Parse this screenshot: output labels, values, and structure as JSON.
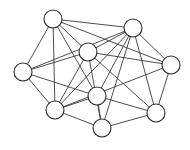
{
  "diagram": {
    "type": "network-graph",
    "width": 190,
    "height": 150,
    "node_radius": 9,
    "colors": {
      "background": "#ffffff",
      "node_fill": "#ffffff",
      "node_stroke": "#2a2a2a",
      "edge_stroke": "#3a3a3a"
    },
    "nodes": [
      {
        "id": "A",
        "x": 53,
        "y": 19
      },
      {
        "id": "B",
        "x": 133,
        "y": 28
      },
      {
        "id": "C",
        "x": 88,
        "y": 52
      },
      {
        "id": "D",
        "x": 23,
        "y": 72
      },
      {
        "id": "E",
        "x": 171,
        "y": 65
      },
      {
        "id": "F",
        "x": 97,
        "y": 96
      },
      {
        "id": "G",
        "x": 55,
        "y": 110
      },
      {
        "id": "H",
        "x": 156,
        "y": 113
      },
      {
        "id": "I",
        "x": 102,
        "y": 128
      }
    ],
    "edges": [
      [
        "A",
        "B"
      ],
      [
        "A",
        "D"
      ],
      [
        "A",
        "G"
      ],
      [
        "A",
        "F"
      ],
      [
        "A",
        "E"
      ],
      [
        "A",
        "C"
      ],
      [
        "B",
        "C"
      ],
      [
        "B",
        "D"
      ],
      [
        "B",
        "G"
      ],
      [
        "B",
        "F"
      ],
      [
        "B",
        "I"
      ],
      [
        "B",
        "H"
      ],
      [
        "B",
        "E"
      ],
      [
        "C",
        "D"
      ],
      [
        "C",
        "E"
      ],
      [
        "C",
        "G"
      ],
      [
        "C",
        "H"
      ],
      [
        "C",
        "I"
      ],
      [
        "D",
        "G"
      ],
      [
        "D",
        "F"
      ],
      [
        "E",
        "G"
      ],
      [
        "E",
        "H"
      ],
      [
        "F",
        "G"
      ],
      [
        "F",
        "H"
      ],
      [
        "F",
        "I"
      ],
      [
        "G",
        "I"
      ],
      [
        "H",
        "I"
      ]
    ]
  }
}
